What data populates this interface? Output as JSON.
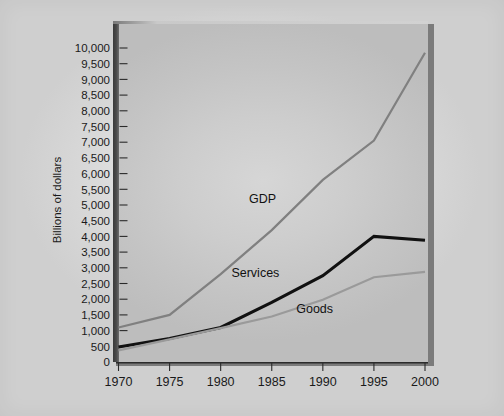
{
  "chart_data": {
    "type": "line",
    "title": "",
    "xlabel": "",
    "ylabel": "Billions of dollars",
    "x": [
      1970,
      1975,
      1980,
      1985,
      1990,
      1995,
      2000
    ],
    "xtick_labels": [
      "1970",
      "1975",
      "1980",
      "1985",
      "1990",
      "1995",
      "2000"
    ],
    "ytick_labels": [
      "0",
      "500",
      "1,000",
      "1,500",
      "2,000",
      "2,500",
      "3,000",
      "3,500",
      "4,000",
      "4,500",
      "5,000",
      "5,500",
      "6,000",
      "6,500",
      "7,000",
      "7,500",
      "8,000",
      "8,500",
      "9,000",
      "9,500",
      "10,000"
    ],
    "ytick_values": [
      0,
      500,
      1000,
      1500,
      2000,
      2500,
      3000,
      3500,
      4000,
      4500,
      5000,
      5500,
      6000,
      6500,
      7000,
      7500,
      8000,
      8500,
      9000,
      9500,
      10000
    ],
    "ylim": [
      0,
      10000
    ],
    "xlim": [
      1970,
      2000
    ],
    "grid": false,
    "legend_position": "inline-annotation",
    "series": [
      {
        "name": "GDP",
        "color": "#808080",
        "width": 2.2,
        "values": [
          1100,
          1500,
          2800,
          4200,
          5800,
          7050,
          9850
        ],
        "label_x": 1984.1,
        "label_y": 5050,
        "label_anchor": "middle"
      },
      {
        "name": "Services",
        "color": "#111111",
        "width": 3.0,
        "values": [
          480,
          750,
          1100,
          1900,
          2750,
          4000,
          3880
        ],
        "label_x": 1983.4,
        "label_y": 2700,
        "label_anchor": "middle"
      },
      {
        "name": "Goods",
        "color": "#9a9a9a",
        "width": 2.2,
        "values": [
          370,
          720,
          1080,
          1450,
          1980,
          2700,
          2870
        ],
        "label_x": 1989.2,
        "label_y": 1560,
        "label_anchor": "middle"
      }
    ]
  },
  "colors": {
    "page_background": "#e6e6e6",
    "panel_background": "#c9c9c9",
    "panel_spine": "#3a3a3a",
    "panel_shadow": "#7b7b7b",
    "text": "#1a1a1a",
    "gdp": "#808080",
    "services": "#111111",
    "goods": "#9a9a9a"
  }
}
